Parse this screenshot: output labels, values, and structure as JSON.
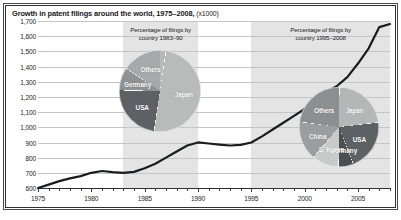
{
  "figure": {
    "title": "Growth in patent filings around the world, 1975–2008,",
    "units": "(x1000)"
  },
  "chart_data": {
    "type": "line",
    "title": "Growth in patent filings around the world, 1975–2008, (x1000)",
    "xlabel": "",
    "ylabel": "",
    "units": "x1000",
    "xlim": [
      1975,
      2008
    ],
    "ylim": [
      600,
      1700
    ],
    "ytick_step": 100,
    "grid": true,
    "legend": "none",
    "ytick_labels": [
      "1,700",
      "1,600",
      "1,500",
      "1,400",
      "1,300",
      "1,200",
      "1,100",
      "1,000",
      "900",
      "800",
      "700",
      "600"
    ],
    "ytick_values": [
      1700,
      1600,
      1500,
      1400,
      1300,
      1200,
      1100,
      1000,
      900,
      800,
      700,
      600
    ],
    "xtick_labels": [
      "1975",
      "1980",
      "1985",
      "1990",
      "1995",
      "2000",
      "2005"
    ],
    "xtick_values": [
      1975,
      1980,
      1985,
      1990,
      1995,
      2000,
      2005
    ],
    "x": [
      1975,
      1976,
      1977,
      1978,
      1979,
      1980,
      1981,
      1982,
      1983,
      1984,
      1985,
      1986,
      1987,
      1988,
      1989,
      1990,
      1991,
      1992,
      1993,
      1994,
      1995,
      1996,
      1997,
      1998,
      1999,
      2000,
      2001,
      2002,
      2003,
      2004,
      2005,
      2006,
      2007,
      2008
    ],
    "values": [
      600,
      622,
      645,
      663,
      678,
      700,
      712,
      705,
      700,
      706,
      730,
      760,
      800,
      840,
      880,
      900,
      893,
      886,
      880,
      884,
      900,
      940,
      985,
      1030,
      1075,
      1120,
      1185,
      1230,
      1270,
      1330,
      1420,
      1520,
      1660,
      1680
    ],
    "series": [
      {
        "name": "Patent filings worldwide",
        "color": "#1a1c1e",
        "values": [
          600,
          622,
          645,
          663,
          678,
          700,
          712,
          705,
          700,
          706,
          730,
          760,
          800,
          840,
          880,
          900,
          893,
          886,
          880,
          884,
          900,
          940,
          985,
          1030,
          1075,
          1120,
          1185,
          1230,
          1270,
          1330,
          1420,
          1520,
          1660,
          1680
        ]
      }
    ],
    "shaded_bands": [
      {
        "label": "1983–90 band",
        "x0": 1983,
        "x1": 1990,
        "color": "#e3e4e3"
      },
      {
        "label": "1995–2008 band",
        "x0": 1995,
        "x1": 2008,
        "color": "#e3e4e3"
      }
    ],
    "insets": [
      {
        "type": "pie",
        "title_line1": "Percentage of filings by",
        "title_line2": "country 1983–90",
        "period": "1983–90",
        "slices": [
          {
            "label": "Japan",
            "value": 50,
            "color": "#b9bbbb"
          },
          {
            "label": "USA",
            "value": 23,
            "color": "#5e6164"
          },
          {
            "label": "Germany",
            "value": 9,
            "color": "#8f9294"
          },
          {
            "label": "Others",
            "value": 18,
            "color": "#a6a9aa"
          }
        ]
      },
      {
        "type": "pie",
        "title_line1": "Percentage of filings by",
        "title_line2": "country 1995–2008",
        "period": "1995–2008",
        "slices": [
          {
            "label": "Japan",
            "value": 23,
            "color": "#b5b7b7"
          },
          {
            "label": "USA",
            "value": 21,
            "color": "#5e6164"
          },
          {
            "label": "Germany",
            "value": 6,
            "color": "#4c4f52"
          },
          {
            "label": "S. Korea",
            "value": 11,
            "color": "#c9cbcb"
          },
          {
            "label": "China",
            "value": 16,
            "color": "#9b9e9f"
          },
          {
            "label": "Others",
            "value": 23,
            "color": "#8c8f90"
          }
        ]
      }
    ]
  }
}
